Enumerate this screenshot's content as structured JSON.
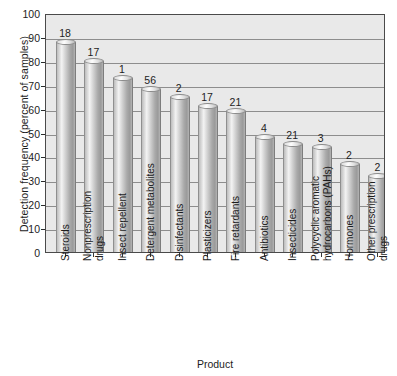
{
  "chart_data": {
    "type": "bar",
    "title": "",
    "xlabel": "Product",
    "ylabel": "Detection frequency (percent of samples)",
    "ylim": [
      0,
      100
    ],
    "ytick_step": 10,
    "yticks": [
      100,
      90,
      80,
      70,
      60,
      50,
      40,
      30,
      20,
      10,
      0
    ],
    "grid": true,
    "legend": "none",
    "categories": [
      "Steroids",
      "Nonprescription drugs",
      "Insect repellent",
      "Detergent metabolites",
      "Disinfectants",
      "Plasticizers",
      "Fire retardants",
      "Antibiotics",
      "Insecticides",
      "Polycyclic aromatic hydrocarbons (PAHs)",
      "Hormones",
      "Other prescription drugs"
    ],
    "category_lines": [
      [
        "Steroids"
      ],
      [
        "Nonprescription",
        "drugs"
      ],
      [
        "Insect repellent"
      ],
      [
        "Detergent metabolites"
      ],
      [
        "Disinfectants"
      ],
      [
        "Plasticizers"
      ],
      [
        "Fire retardants"
      ],
      [
        "Antibiotics"
      ],
      [
        "Insecticides"
      ],
      [
        "Polycyclic aromatic",
        "hydrocarbons (PAHs)"
      ],
      [
        "Hormones"
      ],
      [
        "Other prescription",
        "drugs"
      ]
    ],
    "values": [
      88,
      80,
      73,
      68,
      65,
      61,
      59,
      48,
      45,
      44,
      37,
      32
    ],
    "bar_labels": [
      "18",
      "17",
      "1",
      "56",
      "2",
      "17",
      "21",
      "4",
      "21",
      "3",
      "2",
      "2"
    ],
    "bar_label_meaning": "number of compounds measured per product category"
  },
  "colors": {
    "plot_background": "#e9e9e9",
    "page_background": "#ffffff",
    "gridline": "#8d8d8d",
    "axis": "#4a4a4a",
    "text": "#1d1d1d",
    "bar_light": "#f3f3f3",
    "bar_dark": "#9a9a9a"
  }
}
